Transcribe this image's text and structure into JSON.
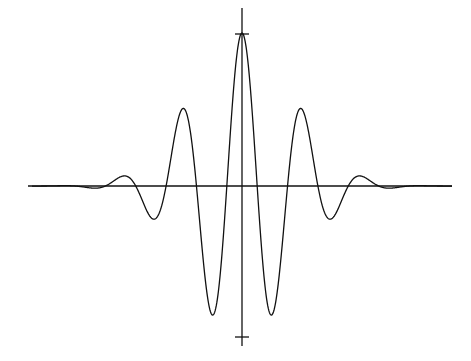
{
  "chart_data": {
    "type": "line",
    "title": "",
    "xlabel": "",
    "ylabel": "",
    "grid": false,
    "legend": null,
    "axes": {
      "origin_px": [
        242,
        186
      ],
      "x_range_px": [
        28,
        452
      ],
      "y_range_px": [
        8,
        346
      ],
      "y_ticks_px": [
        34,
        337
      ]
    },
    "series": [
      {
        "name": "wavelet",
        "color": "#000000",
        "points_px": [
          [
            28,
            186
          ],
          [
            60,
            185
          ],
          [
            92,
            192
          ],
          [
            122,
            163
          ],
          [
            150,
            238
          ],
          [
            182,
            92
          ],
          [
            212,
            321
          ],
          [
            242,
            33
          ],
          [
            271,
            321
          ],
          [
            302,
            92
          ],
          [
            334,
            238
          ],
          [
            362,
            163
          ],
          [
            392,
            192
          ],
          [
            424,
            185
          ],
          [
            452,
            186
          ]
        ],
        "model": {
          "amplitude": 1.0,
          "omega": 5.3,
          "sigma": 1.0,
          "x_min": -4.1,
          "x_max": 4.1
        }
      }
    ]
  }
}
